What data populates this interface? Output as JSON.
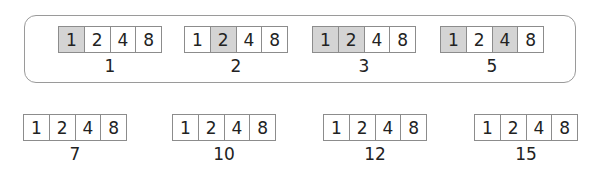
{
  "place_values": [
    "1",
    "2",
    "4",
    "8"
  ],
  "shade_color": "#d4d4d4",
  "top_row": [
    {
      "number": "1",
      "shaded": [
        true,
        false,
        false,
        false
      ],
      "x": 58,
      "y": 26
    },
    {
      "number": "2",
      "shaded": [
        false,
        true,
        false,
        false
      ],
      "x": 184,
      "y": 26
    },
    {
      "number": "3",
      "shaded": [
        true,
        true,
        false,
        false
      ],
      "x": 312,
      "y": 26
    },
    {
      "number": "5",
      "shaded": [
        true,
        false,
        true,
        false
      ],
      "x": 440,
      "y": 26
    }
  ],
  "bottom_row": [
    {
      "number": "7",
      "shaded": [
        false,
        false,
        false,
        false
      ],
      "x": 23,
      "y": 114
    },
    {
      "number": "10",
      "shaded": [
        false,
        false,
        false,
        false
      ],
      "x": 172,
      "y": 114
    },
    {
      "number": "12",
      "shaded": [
        false,
        false,
        false,
        false
      ],
      "x": 323,
      "y": 114
    },
    {
      "number": "15",
      "shaded": [
        false,
        false,
        false,
        false
      ],
      "x": 474,
      "y": 114
    }
  ]
}
